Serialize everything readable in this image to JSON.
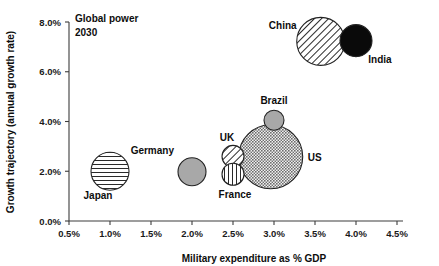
{
  "chart_data": {
    "type": "scatter",
    "title": "",
    "annotation": "Global power\n2030",
    "annotation_line1": "Global power",
    "annotation_line2": "2030",
    "xlabel": "Military expenditure as % GDP",
    "ylabel": "Growth trajectory (annual growth rate)",
    "xlim": [
      0.5,
      4.5
    ],
    "ylim": [
      0.0,
      8.0
    ],
    "xticks": [
      "0.5%",
      "1.0%",
      "1.5%",
      "2.0%",
      "2.5%",
      "3.0%",
      "3.5%",
      "4.0%",
      "4.5%"
    ],
    "xtick_values": [
      0.5,
      1.0,
      1.5,
      2.0,
      2.5,
      3.0,
      3.5,
      4.0,
      4.5
    ],
    "yticks": [
      "0.0%",
      "2.0%",
      "4.0%",
      "6.0%",
      "8.0%"
    ],
    "ytick_values": [
      0.0,
      2.0,
      4.0,
      6.0,
      8.0
    ],
    "grid": false,
    "legend": "none",
    "points": [
      {
        "label": "Japan",
        "x": 1.0,
        "y": 2.0,
        "r": 19,
        "fill": "horizontal-hatch",
        "color": "#ffffff",
        "label_dx": -12,
        "label_dy": 28,
        "label_anchor": "middle"
      },
      {
        "label": "Germany",
        "x": 2.0,
        "y": 1.98,
        "r": 14,
        "fill": "solid-gray",
        "color": "#a8a8a8",
        "label_dx": -18,
        "label_dy": -18,
        "label_anchor": "end"
      },
      {
        "label": "UK",
        "x": 2.5,
        "y": 2.6,
        "r": 11,
        "fill": "diagonal-hatch",
        "color": "#ffffff",
        "label_dx": -6,
        "label_dy": -15,
        "label_anchor": "middle"
      },
      {
        "label": "France",
        "x": 2.5,
        "y": 1.88,
        "r": 11,
        "fill": "vertical-hatch",
        "color": "#ffffff",
        "label_dx": 2,
        "label_dy": 24,
        "label_anchor": "middle"
      },
      {
        "label": "Brazil",
        "x": 3.0,
        "y": 4.05,
        "r": 10,
        "fill": "solid-gray",
        "color": "#a8a8a8",
        "label_dx": 0,
        "label_dy": -16,
        "label_anchor": "middle"
      },
      {
        "label": "US",
        "x": 2.96,
        "y": 2.58,
        "r": 32,
        "fill": "checker-gray",
        "color": "#9a9a9a",
        "label_dx": 44,
        "label_dy": 4,
        "label_anchor": "middle"
      },
      {
        "label": "China",
        "x": 3.57,
        "y": 7.22,
        "r": 24,
        "fill": "diagonal-hatch",
        "color": "#ffffff",
        "label_dx": -38,
        "label_dy": -12,
        "label_anchor": "middle"
      },
      {
        "label": "India",
        "x": 4.0,
        "y": 7.25,
        "r": 16,
        "fill": "solid-black",
        "color": "#0a0a0a",
        "label_dx": 24,
        "label_dy": 22,
        "label_anchor": "middle"
      }
    ]
  },
  "colors": {
    "axis": "#3d3d3d",
    "text": "#0d0d0d",
    "gray_fill": "#a8a8a8",
    "black_fill": "#0a0a0a",
    "white_fill": "#ffffff"
  }
}
